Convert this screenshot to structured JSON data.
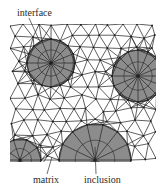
{
  "diagram": {
    "type": "finite-element mesh of a particle-reinforced composite",
    "colors": {
      "background": "#ffffff",
      "mesh_line": "#2b2b2b",
      "inclusion_fill": "#8c8c8c",
      "node": "#1e1e1e",
      "label": "#2a2a2a"
    },
    "mesh_bounds": {
      "x0": 10,
      "y0": 24,
      "x1": 156,
      "y1": 162
    },
    "inclusions": [
      {
        "name": "inclusion-top-left",
        "cx": 51,
        "cy": 63,
        "r": 24,
        "spokes": 16
      },
      {
        "name": "inclusion-right",
        "cx": 138,
        "cy": 76,
        "r": 26,
        "spokes": 16
      },
      {
        "name": "inclusion-bottom-center",
        "cx": 95,
        "cy": 160,
        "r": 36,
        "spokes": 14
      },
      {
        "name": "inclusion-bottom-left",
        "cx": 20,
        "cy": 160,
        "r": 21,
        "spokes": 10
      }
    ],
    "labels": [
      {
        "id": "interface",
        "text": "interface",
        "x": 17,
        "y": 16,
        "leader": [
          29,
          18,
          40,
          42
        ]
      },
      {
        "id": "matrix",
        "text": "matrix",
        "x": 33,
        "y": 183,
        "leader": [
          47,
          174,
          52,
          157
        ]
      },
      {
        "id": "inclusion",
        "text": "inclusion",
        "x": 84,
        "y": 183,
        "leader": [
          96,
          174,
          95,
          147
        ]
      }
    ]
  }
}
